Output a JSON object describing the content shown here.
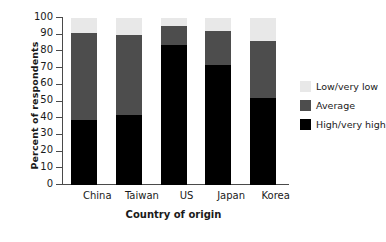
{
  "chart_data": {
    "type": "bar",
    "subtype": "stacked-vertical-100",
    "title": "",
    "xlabel": "Country of origin",
    "ylabel": "Percent of respondents",
    "categories": [
      "China",
      "Taiwan",
      "US",
      "Japan",
      "Korea"
    ],
    "series": [
      {
        "name": "High/very high",
        "color": "#000000",
        "values": [
          39,
          42,
          84,
          72,
          52
        ]
      },
      {
        "name": "Average",
        "color": "#4d4d4d",
        "values": [
          52,
          48,
          11,
          20,
          34
        ]
      },
      {
        "name": "Low/very low",
        "color": "#e8e8e8",
        "values": [
          9,
          10,
          5,
          8,
          14
        ]
      }
    ],
    "stack_order_bottom_to_top": [
      "High/very high",
      "Average",
      "Low/very low"
    ],
    "ylim": [
      0,
      100
    ],
    "ytick_step": 10,
    "yticks": [
      0,
      10,
      20,
      30,
      40,
      50,
      60,
      70,
      80,
      90,
      100
    ],
    "ytick_labels": [
      "0",
      "10",
      "20",
      "30",
      "40",
      "50",
      "60",
      "70",
      "80",
      "90",
      "100"
    ],
    "grid": false,
    "legend_position": "right",
    "legend_entries": [
      {
        "label": "Low/very low",
        "color": "#e8e8e8"
      },
      {
        "label": "Average",
        "color": "#4d4d4d"
      },
      {
        "label": "High/very high",
        "color": "#000000"
      }
    ]
  }
}
